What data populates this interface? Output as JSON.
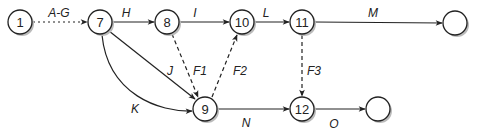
{
  "diagram": {
    "type": "activity-on-arrow network",
    "nodes": [
      {
        "id": "n1",
        "label": "1",
        "x": 20,
        "y": 22
      },
      {
        "id": "n7",
        "label": "7",
        "x": 100,
        "y": 22
      },
      {
        "id": "n8",
        "label": "8",
        "x": 167,
        "y": 22
      },
      {
        "id": "n10",
        "label": "10",
        "x": 242,
        "y": 22
      },
      {
        "id": "n11",
        "label": "11",
        "x": 302,
        "y": 22
      },
      {
        "id": "nEndTop",
        "label": "",
        "x": 455,
        "y": 23
      },
      {
        "id": "n9",
        "label": "9",
        "x": 205,
        "y": 109
      },
      {
        "id": "n12",
        "label": "12",
        "x": 302,
        "y": 109
      },
      {
        "id": "nEndBottom",
        "label": "",
        "x": 378,
        "y": 109
      }
    ],
    "edges": [
      {
        "from": "1",
        "to": "7",
        "label": "A-G",
        "style": "dotted"
      },
      {
        "from": "7",
        "to": "8",
        "label": "H",
        "style": "solid"
      },
      {
        "from": "8",
        "to": "10",
        "label": "I",
        "style": "solid"
      },
      {
        "from": "10",
        "to": "11",
        "label": "L",
        "style": "solid"
      },
      {
        "from": "11",
        "to": "end-top",
        "label": "M",
        "style": "solid"
      },
      {
        "from": "7",
        "to": "9",
        "label": "J",
        "style": "solid"
      },
      {
        "from": "7",
        "to": "9",
        "label": "K",
        "style": "solid-curved"
      },
      {
        "from": "8",
        "to": "9",
        "label": "F1",
        "style": "dashed"
      },
      {
        "from": "9",
        "to": "10",
        "label": "F2",
        "style": "dashed"
      },
      {
        "from": "11",
        "to": "12",
        "label": "F3",
        "style": "dashed"
      },
      {
        "from": "9",
        "to": "12",
        "label": "N",
        "style": "solid"
      },
      {
        "from": "12",
        "to": "end-bottom",
        "label": "O",
        "style": "solid"
      }
    ]
  },
  "labels": {
    "n1": "1",
    "n7": "7",
    "n8": "8",
    "n10": "10",
    "n11": "11",
    "n9": "9",
    "n12": "12",
    "AG": "A-G",
    "H": "H",
    "I": "I",
    "L": "L",
    "M": "M",
    "J": "J",
    "K": "K",
    "F1": "F1",
    "F2": "F2",
    "F3": "F3",
    "N": "N",
    "O": "O"
  }
}
